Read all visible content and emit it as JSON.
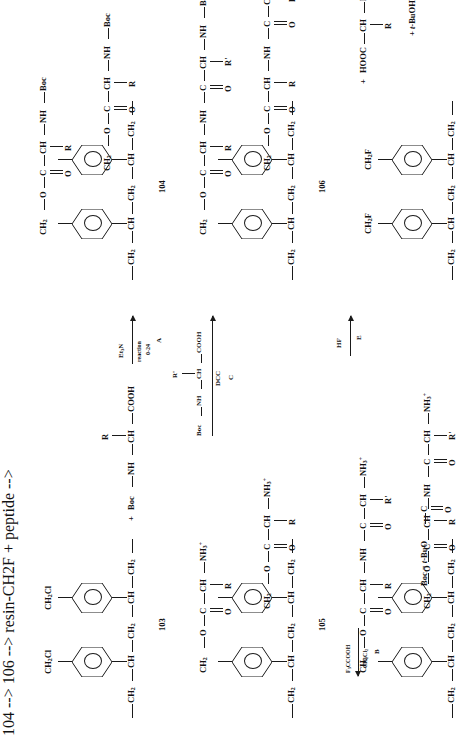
{
  "scheme": {
    "title": "Merrifield solid-phase peptide synthesis scheme",
    "orientation": "rotated-90",
    "compound_numbers": {
      "c103": "103",
      "c104": "104",
      "c105": "105",
      "c106": "106"
    },
    "legend": {
      "boc_definition_prefix": "Boc =",
      "boc_definition": "t-BuO",
      "boc_bond": "C",
      "boc_oxygen": "O"
    },
    "steps": {
      "a": {
        "label": "A",
        "above": "Et3N",
        "below_1": "reaction",
        "below_2": "0-24"
      },
      "b": {
        "label": "B",
        "above": "F3CCOOH",
        "below": "CH2Cl2"
      },
      "c": {
        "label": "C",
        "above": "Boc-NH-CH(R')-COOH",
        "below": "DCC"
      },
      "d": {
        "label": "D",
        "above": "F3CCOOH",
        "below": "CH2Cl2"
      },
      "e": {
        "label": "E",
        "above": "HF"
      }
    },
    "atoms": {
      "ch2": "CH2",
      "ch": "CH",
      "ch2cl": "CH2Cl",
      "ch2f": "CH2F",
      "o": "O",
      "c": "C",
      "nh": "NH",
      "n": "N",
      "r": "R",
      "rprime": "R'",
      "boc": "Boc",
      "cooh": "COOH",
      "hooc": "HOOC",
      "nh3plus": "NH3+",
      "plus": "+",
      "dash": "—"
    },
    "reagents": {
      "boc_amino_acid_plus": "+ Boc",
      "byproducts": "+ t-BuOH + CO2"
    },
    "panels": [
      {
        "id": "panel-103",
        "compound": "103",
        "description": "Chloromethylated polystyrene resin",
        "pendant": "CH2Cl",
        "reagent_text": "+ Boc — NH — CH(R) — COOH",
        "step_out": "A"
      },
      {
        "id": "panel-104",
        "compound": "104",
        "description": "Boc-amino acid ester attached to resin",
        "chain": "CH2 — O — C(=O) — CH(R) — NH — Boc",
        "step_out": "B"
      },
      {
        "id": "panel-105",
        "compound": "105",
        "description": "Deprotected amino-acid resin, ammonium salt",
        "chain": "CH2 — O — C(=O) — CH(R) — NH3+",
        "step_out": "C"
      },
      {
        "id": "panel-106",
        "compound": "106",
        "description": "Boc-protected dipeptide resin",
        "chain": "CH2 — O — C(=O) — CH(R) — NH — C(=O) — CH(R') — NH — Boc",
        "step_out": "D"
      },
      {
        "id": "panel-107",
        "compound": "",
        "description": "Deprotected dipeptide resin ammonium salt",
        "chain": "CH2 — O — C(=O) — CH(R) — NH — C(=O) — CH(R') — NH3+",
        "step_out": "E"
      },
      {
        "id": "panel-cleaved",
        "compound": "",
        "description": "Fluoromethylated resin plus free dipeptide after HF cleavage",
        "pendant": "CH2F",
        "product": "+ HOOC — CH(R) — NH — C(=O) — CH(R') — NH3+",
        "byproducts": "+ t-BuOH + CO2"
      }
    ]
  }
}
